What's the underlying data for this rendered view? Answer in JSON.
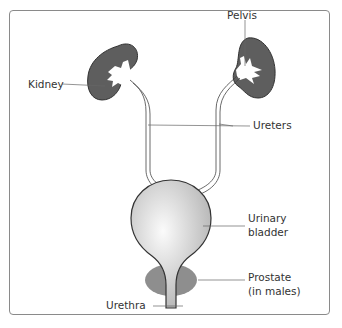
{
  "diagram": {
    "labels": {
      "kidney": "Kidney",
      "pelvis": "Pelvis",
      "ureters": "Ureters",
      "bladder_line1": "Urinary",
      "bladder_line2": "bladder",
      "prostate_line1": "Prostate",
      "prostate_line2": "(in males)",
      "urethra": "Urethra"
    },
    "colors": {
      "kidney_fill": "#5e5e5e",
      "bladder_fill": "#c8c8c8",
      "prostate_fill": "#8e8e8e",
      "outline": "#333333",
      "frame": "#8a8a8a"
    }
  }
}
